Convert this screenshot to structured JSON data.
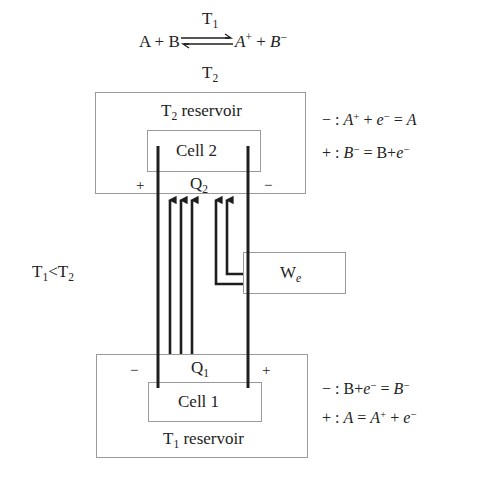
{
  "reaction": {
    "left": "A + B",
    "right_species_a": "A",
    "right_species_a_charge": "+",
    "right_plus": "+",
    "right_species_b": "B",
    "right_species_b_charge": "−",
    "forward_label": "T",
    "forward_label_sub": "1",
    "reverse_label": "T",
    "reverse_label_sub": "2"
  },
  "hot_reservoir": {
    "label": "T",
    "label_sub": "2",
    "label_rest": " reservoir",
    "cell_label": "Cell 2",
    "heat_label": "Q",
    "heat_sub": "2",
    "left_terminal": "+",
    "right_terminal": "−",
    "equations": [
      {
        "sign": "−",
        "parts": [
          "A",
          "+",
          " + ",
          "e",
          "−",
          " = ",
          "A"
        ]
      },
      {
        "sign": "+",
        "parts": [
          "B",
          "−",
          " = B+",
          "e",
          "−"
        ]
      }
    ]
  },
  "cold_reservoir": {
    "label": "T",
    "label_sub": "1",
    "label_rest": " reservoir",
    "cell_label": "Cell 1",
    "heat_label": "Q",
    "heat_sub": "1",
    "left_terminal": "−",
    "right_terminal": "+",
    "equations": [
      {
        "sign": "−",
        "parts": [
          "B+",
          "e",
          "−",
          " = ",
          "B",
          "−"
        ]
      },
      {
        "sign": "+",
        "parts": [
          "A",
          " = ",
          "A",
          "+",
          " + ",
          "e",
          "−"
        ]
      }
    ]
  },
  "work": {
    "label": "W",
    "label_sub": "e"
  },
  "condition": {
    "t_low": "T",
    "t_low_sub": "1",
    "relation": "<",
    "t_high": "T",
    "t_high_sub": "2"
  },
  "colors": {
    "wire": "#1e1e1e",
    "box_border": "#9a9a9a",
    "text": "#222222"
  }
}
